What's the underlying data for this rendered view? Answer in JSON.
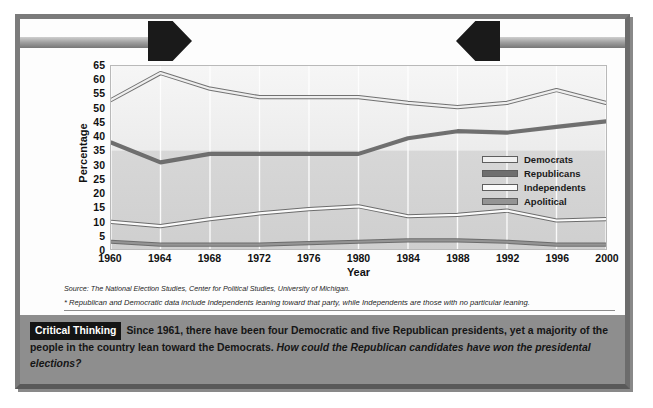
{
  "figure": {
    "title": "Political Party Identification*"
  },
  "axes": {
    "y_title": "Percentage",
    "x_title": "Year",
    "y_ticks": [
      "65",
      "60",
      "55",
      "50",
      "45",
      "40",
      "35",
      "30",
      "25",
      "20",
      "15",
      "10",
      "5",
      "0"
    ],
    "x_ticks": [
      "1960",
      "1964",
      "1968",
      "1972",
      "1976",
      "1980",
      "1984",
      "1988",
      "1992",
      "1996",
      "2000"
    ]
  },
  "legend": {
    "items": [
      {
        "label": "Democrats",
        "color": "#efefef"
      },
      {
        "label": "Republicans",
        "color": "#6f6f6f"
      },
      {
        "label": "Independents",
        "color": "#fbfbfb"
      },
      {
        "label": "Apolitical",
        "color": "#949494"
      }
    ]
  },
  "source": {
    "line": "Source: The National Election Studies, Center for Political Studies, University of Michigan.",
    "footnote": "* Republican and Democratic data include Independents leaning toward that party, while Independents are those with no particular leaning."
  },
  "critical_thinking": {
    "tag": "Critical Thinking",
    "sentence_1": "Since 1961, there have been four Democratic and five Republican presidents, yet a majority of the people in the country lean toward the Democrats.",
    "question": "How could the Republican candidates have won the presidental elections?"
  },
  "chart_data": {
    "type": "line",
    "title": "Political Party Identification*",
    "xlabel": "Year",
    "ylabel": "Percentage",
    "x": [
      1960,
      1964,
      1968,
      1972,
      1976,
      1980,
      1984,
      1988,
      1992,
      1996,
      2000
    ],
    "xlim": [
      1960,
      2000
    ],
    "ylim": [
      0,
      65
    ],
    "ytick_step": 5,
    "grid": "vertical",
    "legend_position": "inside-right",
    "series": [
      {
        "name": "Democrats",
        "color": "#efefef",
        "values": [
          53.0,
          62.5,
          57.0,
          54.0,
          54.0,
          54.0,
          52.0,
          50.5,
          52.0,
          56.5,
          52.0
        ]
      },
      {
        "name": "Republicans",
        "color": "#6f6f6f",
        "values": [
          38.0,
          31.0,
          34.0,
          34.0,
          34.0,
          34.0,
          39.5,
          42.0,
          41.5,
          43.5,
          45.5
        ]
      },
      {
        "name": "Independents",
        "color": "#fbfbfb",
        "values": [
          10.0,
          8.5,
          11.0,
          13.0,
          14.5,
          15.5,
          12.0,
          12.5,
          14.0,
          10.5,
          11.0
        ]
      },
      {
        "name": "Apolitical",
        "color": "#949494",
        "values": [
          3.0,
          2.0,
          2.0,
          2.0,
          2.5,
          3.0,
          3.5,
          3.5,
          3.0,
          2.0,
          2.0
        ]
      }
    ]
  }
}
